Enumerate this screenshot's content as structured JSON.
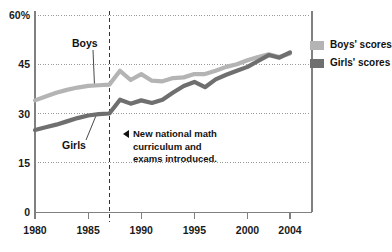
{
  "chart_data": {
    "type": "line",
    "title": "",
    "xlabel": "",
    "ylabel": "",
    "xlim": [
      1980,
      2004
    ],
    "ylim": [
      0,
      60
    ],
    "grid": true,
    "legend_position": "right",
    "y_ticks": [
      "60%",
      "45",
      "30",
      "15",
      "0"
    ],
    "y_tick_values": [
      60,
      45,
      30,
      15,
      0
    ],
    "x_ticks": [
      "1980",
      "1985",
      "1990",
      "1995",
      "2000",
      "2004"
    ],
    "x_tick_values": [
      1980,
      1985,
      1990,
      1995,
      2000,
      2004
    ],
    "x": [
      1980,
      1981,
      1982,
      1983,
      1984,
      1985,
      1986,
      1987,
      1988,
      1989,
      1990,
      1991,
      1992,
      1993,
      1994,
      1995,
      1996,
      1997,
      1998,
      1999,
      2000,
      2001,
      2002,
      2003,
      2004
    ],
    "series": [
      {
        "name": "Boys' scores",
        "color": "#b4b4b4",
        "values": [
          34.0,
          35.2,
          36.3,
          37.2,
          37.9,
          38.4,
          38.6,
          38.8,
          43.0,
          40.2,
          42.0,
          40.0,
          39.8,
          40.8,
          41.0,
          42.0,
          42.0,
          43.0,
          44.2,
          45.0,
          46.2,
          47.2,
          48.0,
          47.2,
          48.3
        ]
      },
      {
        "name": "Girls' scores",
        "color": "#6f6f6f",
        "values": [
          25.0,
          25.8,
          26.6,
          27.6,
          28.6,
          29.4,
          29.8,
          30.0,
          34.2,
          33.0,
          34.0,
          33.2,
          34.2,
          36.4,
          38.4,
          39.6,
          38.0,
          40.4,
          41.8,
          43.0,
          44.2,
          46.0,
          47.8,
          47.0,
          48.6
        ]
      }
    ],
    "annotations": [
      {
        "name": "policy-marker",
        "x": 1987,
        "style": "dashed-vertical-line",
        "text_line1": "New national math",
        "text_line2": "curriculum and",
        "text_line3": "exams introduced."
      }
    ],
    "inline_labels": [
      {
        "name": "boys",
        "text": "Boys",
        "points_to_x": 1985.6,
        "points_to_y": 38.5
      },
      {
        "name": "girls",
        "text": "Girls",
        "points_to_x": 1985.8,
        "points_to_y": 29.8
      }
    ]
  },
  "legend": {
    "items": [
      {
        "label": "Boys' scores",
        "color": "#b4b4b4"
      },
      {
        "label": "Girls' scores",
        "color": "#6f6f6f"
      }
    ]
  },
  "axes": {
    "axis_color": "#808080",
    "grid_color": "#9a9a9a"
  }
}
